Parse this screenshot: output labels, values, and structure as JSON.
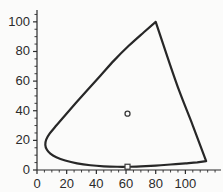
{
  "figure": {
    "background_color": "#fbfbfa",
    "ink_color": "#2b2b2b",
    "curve_color": "#272727"
  },
  "chart_data": {
    "type": "line",
    "title": "",
    "subtitle": "",
    "xlabel": "",
    "ylabel": "",
    "grid": false,
    "legend": null,
    "xlim": [
      0,
      124
    ],
    "ylim": [
      0,
      108
    ],
    "xticks": [
      0,
      20,
      40,
      60,
      80,
      100
    ],
    "yticks": [
      0,
      20,
      40,
      60,
      80,
      100
    ],
    "xtick_labels": [
      "0",
      "20",
      "40",
      "60",
      "80",
      "100"
    ],
    "ytick_labels": [
      "0",
      "20",
      "40",
      "60",
      "80",
      "100"
    ],
    "minor_tick_step": 5,
    "axis_style": "left-and-bottom-spines",
    "series": [
      {
        "name": "boundary-curve",
        "type": "closed-curve",
        "linewidth": 2.2,
        "color": "#272727",
        "points": [
          [
            80,
            100
          ],
          [
            72,
            93
          ],
          [
            62,
            84
          ],
          [
            52,
            74
          ],
          [
            43,
            64
          ],
          [
            34,
            54
          ],
          [
            26,
            45
          ],
          [
            19,
            37
          ],
          [
            13,
            30
          ],
          [
            8.5,
            24.5
          ],
          [
            6.2,
            20.5
          ],
          [
            5.6,
            17.0
          ],
          [
            6.6,
            13.8
          ],
          [
            9.0,
            11.0
          ],
          [
            13.0,
            8.6
          ],
          [
            19.0,
            6.4
          ],
          [
            27.0,
            4.5
          ],
          [
            36.0,
            3.2
          ],
          [
            45.0,
            2.5
          ],
          [
            54.0,
            2.2
          ],
          [
            61.0,
            2.2
          ],
          [
            70.0,
            2.5
          ],
          [
            80.0,
            3.0
          ],
          [
            90.0,
            3.7
          ],
          [
            100.0,
            4.5
          ],
          [
            108.0,
            5.2
          ],
          [
            114.0,
            6.0
          ],
          [
            105.0,
            30.0
          ],
          [
            96.0,
            53.0
          ],
          [
            88.0,
            76.0
          ],
          [
            80.0,
            100.0
          ]
        ]
      }
    ],
    "markers": [
      {
        "name": "interior-circle-marker",
        "shape": "circle",
        "x": 61,
        "y": 38,
        "size": 5,
        "filled": false,
        "color": "#3a3a3a"
      },
      {
        "name": "baseline-square-marker",
        "shape": "square",
        "x": 61,
        "y": 2.2,
        "size": 5,
        "filled": false,
        "color": "#3a3a3a"
      }
    ]
  }
}
